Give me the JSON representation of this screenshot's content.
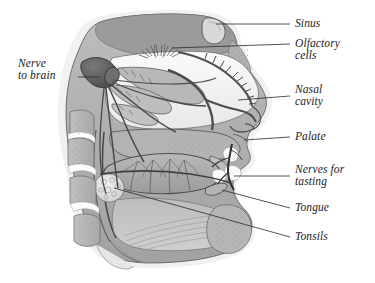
{
  "figure": {
    "type": "anatomical-diagram",
    "style": "grayscale medical illustration",
    "background_color": "#ffffff",
    "outline_color": "#3b3b3b",
    "leader_line_color": "#2a2a2a",
    "tissue_color": "#a9a9a9",
    "airway_color": "#f2f2f2",
    "bone_color": "#b4b4b4",
    "dark_nerve_color": "#4a4a4a",
    "label_color": "#1b1b1b"
  },
  "labels": {
    "sinus": {
      "text": "Sinus",
      "lines": [
        "Sinus"
      ]
    },
    "olfactory_cells": {
      "text": "Olfactory cells",
      "lines": [
        "Olfactory",
        "cells"
      ]
    },
    "nasal_cavity": {
      "text": "Nasal cavity",
      "lines": [
        "Nasal",
        "cavity"
      ]
    },
    "palate": {
      "text": "Palate",
      "lines": [
        "Palate"
      ]
    },
    "nerves_for_tasting": {
      "text": "Nerves for tasting",
      "lines": [
        "Nerves for",
        "tasting"
      ]
    },
    "tongue": {
      "text": "Tongue",
      "lines": [
        "Tongue"
      ]
    },
    "tonsils": {
      "text": "Tonsils",
      "lines": [
        "Tonsils"
      ]
    },
    "nerve_to_brain": {
      "text": "Nerve to brain",
      "lines": [
        "Nerve",
        "to brain"
      ]
    }
  }
}
